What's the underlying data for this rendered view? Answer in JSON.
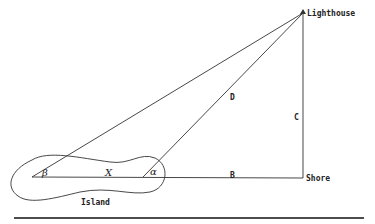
{
  "diagram": {
    "labels": {
      "lighthouse": "Lighthouse",
      "shore": "Shore",
      "island": "Island",
      "side_b": "B",
      "side_c": "C",
      "side_d": "D",
      "side_x": "X",
      "angle_alpha": "α",
      "angle_beta": "β"
    },
    "points": {
      "beta_vertex": [
        32,
        177
      ],
      "alpha_vertex": [
        143,
        177
      ],
      "lighthouse": [
        303,
        13
      ],
      "shore": [
        303,
        178
      ]
    },
    "colors": {
      "line": "#333333",
      "text": "#222222",
      "background": "#ffffff"
    }
  }
}
